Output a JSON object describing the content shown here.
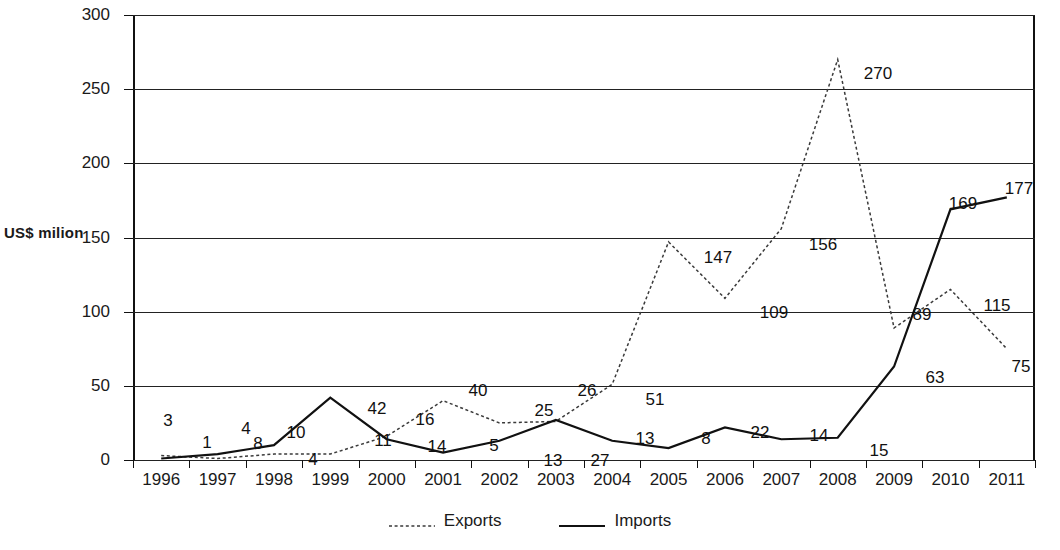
{
  "chart_data": {
    "type": "line",
    "title": "",
    "xlabel": "",
    "ylabel": "US$ milion",
    "ylim": [
      0,
      300
    ],
    "yticks": [
      0,
      50,
      100,
      150,
      200,
      250,
      300
    ],
    "grid": true,
    "legend_position": "bottom",
    "categories": [
      "1996",
      "1997",
      "1998",
      "1999",
      "2000",
      "2001",
      "2002",
      "2003",
      "2004",
      "2005",
      "2006",
      "2007",
      "2008",
      "2009",
      "2010",
      "2011"
    ],
    "series": [
      {
        "name": "Exports",
        "style": "dotted",
        "values": [
          3,
          1,
          4,
          4,
          16,
          40,
          25,
          26,
          51,
          147,
          109,
          156,
          270,
          89,
          115,
          75
        ]
      },
      {
        "name": "Imports",
        "style": "solid",
        "values": [
          1,
          4,
          10,
          42,
          14,
          5,
          13,
          27,
          13,
          8,
          22,
          14,
          15,
          63,
          169,
          177
        ]
      }
    ]
  },
  "axis": {
    "y_title": "US$ milion",
    "y_tick_labels": [
      "0",
      "50",
      "100",
      "150",
      "200",
      "250",
      "300"
    ],
    "x_tick_labels": [
      "1996",
      "1997",
      "1998",
      "1999",
      "2000",
      "2001",
      "2002",
      "2003",
      "2004",
      "2005",
      "2006",
      "2007",
      "2008",
      "2009",
      "2010",
      "2011"
    ]
  },
  "legend": {
    "items": [
      {
        "label": "Exports",
        "swatch": "dashed-line-swatch"
      },
      {
        "label": "Imports",
        "swatch": "solid-line-swatch"
      }
    ]
  },
  "data_labels": [
    {
      "text": "3",
      "x": 168,
      "y": 411
    },
    {
      "text": "1",
      "x": 207,
      "y": 433
    },
    {
      "text": "4",
      "x": 246,
      "y": 419
    },
    {
      "text": "8",
      "x": 258,
      "y": 434
    },
    {
      "text": "10",
      "x": 296,
      "y": 423
    },
    {
      "text": "4",
      "x": 313,
      "y": 450
    },
    {
      "text": "42",
      "x": 377,
      "y": 399
    },
    {
      "text": "11",
      "x": 383,
      "y": 431
    },
    {
      "text": "16",
      "x": 425,
      "y": 410
    },
    {
      "text": "14",
      "x": 437,
      "y": 437
    },
    {
      "text": "40",
      "x": 478,
      "y": 381
    },
    {
      "text": "5",
      "x": 494,
      "y": 436
    },
    {
      "text": "25",
      "x": 544,
      "y": 401
    },
    {
      "text": "13",
      "x": 553,
      "y": 451
    },
    {
      "text": "26",
      "x": 587,
      "y": 381
    },
    {
      "text": "27",
      "x": 600,
      "y": 451
    },
    {
      "text": "51",
      "x": 655,
      "y": 390
    },
    {
      "text": "13",
      "x": 645,
      "y": 429
    },
    {
      "text": "147",
      "x": 718,
      "y": 248
    },
    {
      "text": "8",
      "x": 706,
      "y": 429
    },
    {
      "text": "109",
      "x": 774,
      "y": 303
    },
    {
      "text": "22",
      "x": 760,
      "y": 423
    },
    {
      "text": "156",
      "x": 823,
      "y": 235
    },
    {
      "text": "14",
      "x": 819,
      "y": 426
    },
    {
      "text": "270",
      "x": 878,
      "y": 64
    },
    {
      "text": "15",
      "x": 879,
      "y": 441
    },
    {
      "text": "89",
      "x": 922,
      "y": 305
    },
    {
      "text": "63",
      "x": 935,
      "y": 368
    },
    {
      "text": "169",
      "x": 963,
      "y": 194
    },
    {
      "text": "115",
      "x": 997,
      "y": 296
    },
    {
      "text": "177",
      "x": 1019,
      "y": 179
    },
    {
      "text": "75",
      "x": 1021,
      "y": 357
    }
  ]
}
